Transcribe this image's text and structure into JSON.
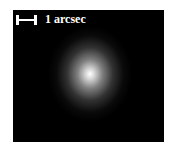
{
  "image": {
    "description": "Astronomical image of a diffuse, roughly circular glowing source on black background",
    "scale_bar": {
      "label": "1 arcsec"
    },
    "colors": {
      "background": "#000000",
      "source_core": "#ffffff",
      "frame": "#ffffff"
    }
  }
}
